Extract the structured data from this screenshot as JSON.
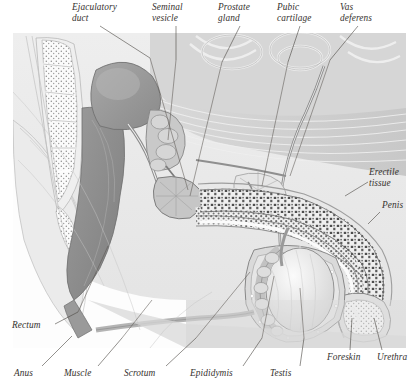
{
  "figure": {
    "style": "greyscale anatomical cutaway illustration",
    "background_color": "#ffffff",
    "ink_color": "#35312e"
  },
  "labels": [
    {
      "id": "ejaculatory-duct",
      "text": "Ejaculatory\nduct",
      "x": 72,
      "y": 2,
      "anchor": "left",
      "leader": [
        [
          100,
          26
        ],
        [
          150,
          58
        ]
      ]
    },
    {
      "id": "seminal-vesicle",
      "text": "Seminal\nvesicle",
      "x": 152,
      "y": 2,
      "anchor": "left",
      "leader": [
        [
          176,
          26
        ],
        [
          176,
          60
        ]
      ]
    },
    {
      "id": "prostate-gland",
      "text": "Prostate\ngland",
      "x": 218,
      "y": 2,
      "anchor": "left",
      "leader": [
        [
          240,
          26
        ],
        [
          222,
          62
        ]
      ]
    },
    {
      "id": "pubic-cartilage",
      "text": "Pubic\ncartilage",
      "x": 277,
      "y": 2,
      "anchor": "left",
      "leader": [
        [
          300,
          26
        ],
        [
          288,
          62
        ]
      ]
    },
    {
      "id": "vas-deferens",
      "text": "Vas\ndeferens",
      "x": 340,
      "y": 2,
      "anchor": "left",
      "leader": [
        [
          358,
          26
        ],
        [
          330,
          60
        ]
      ]
    },
    {
      "id": "erectile-tissue",
      "text": "Erectile\ntissue",
      "x": 369,
      "y": 167,
      "anchor": "left",
      "leader": [
        [
          368,
          182
        ],
        [
          345,
          196
        ]
      ]
    },
    {
      "id": "penis",
      "text": "Penis",
      "x": 382,
      "y": 200,
      "anchor": "left",
      "leader": [
        [
          380,
          212
        ],
        [
          368,
          224
        ]
      ]
    },
    {
      "id": "rectum",
      "text": "Rectum",
      "x": 12,
      "y": 320,
      "anchor": "left",
      "leader": [
        [
          55,
          324
        ],
        [
          78,
          312
        ]
      ]
    },
    {
      "id": "anus",
      "text": "Anus",
      "x": 14,
      "y": 368,
      "anchor": "left",
      "leader": [
        [
          42,
          366
        ],
        [
          72,
          336
        ]
      ]
    },
    {
      "id": "muscle",
      "text": "Muscle",
      "x": 64,
      "y": 368,
      "anchor": "left",
      "leader": [
        [
          98,
          366
        ],
        [
          122,
          338
        ]
      ]
    },
    {
      "id": "scrotum",
      "text": "Scrotum",
      "x": 124,
      "y": 368,
      "anchor": "left",
      "leader": [
        [
          166,
          366
        ],
        [
          196,
          338
        ]
      ]
    },
    {
      "id": "epididymis",
      "text": "Epididymis",
      "x": 190,
      "y": 368,
      "anchor": "left",
      "leader": [
        [
          243,
          366
        ],
        [
          262,
          338
        ]
      ]
    },
    {
      "id": "testis",
      "text": "Testis",
      "x": 270,
      "y": 368,
      "anchor": "left",
      "leader": [
        [
          300,
          366
        ],
        [
          304,
          338
        ]
      ]
    },
    {
      "id": "foreskin",
      "text": "Foreskin",
      "x": 327,
      "y": 352,
      "anchor": "left",
      "leader": [
        [
          350,
          350
        ],
        [
          352,
          318
        ]
      ]
    },
    {
      "id": "urethra",
      "text": "Urethra",
      "x": 377,
      "y": 352,
      "anchor": "left",
      "leader": [
        [
          382,
          350
        ],
        [
          374,
          318
        ]
      ]
    }
  ],
  "structures": [
    {
      "id": "body-outline",
      "name": "Body / torso outline",
      "tone": "#f2f2f2"
    },
    {
      "id": "abdominal-cavity",
      "name": "Abdominal wall and muscle",
      "tone": "#d8d8d8"
    },
    {
      "id": "sacrum",
      "name": "Sacrum and coccyx vertebrae",
      "tone": "#fafafa"
    },
    {
      "id": "bladder",
      "name": "Urinary bladder",
      "tone": "#9a9a9a"
    },
    {
      "id": "rectum-mass",
      "name": "Rectum",
      "tone": "#8f8f8f"
    },
    {
      "id": "seminal-vesicle-org",
      "name": "Seminal vesicle",
      "tone": "#bdbdbd"
    },
    {
      "id": "prostate-org",
      "name": "Prostate gland",
      "tone": "#c4c4c4"
    },
    {
      "id": "pubic-bone",
      "name": "Pubic cartilage / symphysis",
      "tone": "#e4e4e4"
    },
    {
      "id": "corpus-cavernosum",
      "name": "Erectile tissue of penis",
      "tone": "#6f6f6f"
    },
    {
      "id": "corpus-spongiosum",
      "name": "Erectile tissue, urethral",
      "tone": "#7d7d7d"
    },
    {
      "id": "testis-org",
      "name": "Testis",
      "tone": "#e8e8e8"
    },
    {
      "id": "epididymis-org",
      "name": "Epididymis",
      "tone": "#d0d0d0"
    },
    {
      "id": "scrotum-sac",
      "name": "Scrotum",
      "tone": "#cfcfcf"
    },
    {
      "id": "glans",
      "name": "Glans and foreskin",
      "tone": "#dcdcdc"
    }
  ]
}
